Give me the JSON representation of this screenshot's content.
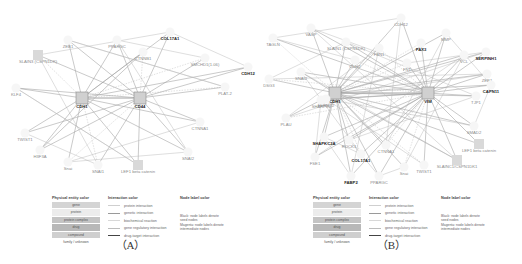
{
  "panels": [
    {
      "id": "A",
      "caption": "（A）",
      "nodes": [
        {
          "label": "SLAIN3 (CSPN1DK)",
          "x": 38,
          "y": 55,
          "dark": false,
          "shape": "square"
        },
        {
          "label": "ZEB1",
          "x": 68,
          "y": 40,
          "dark": false,
          "shape": "circle"
        },
        {
          "label": "PPARGC",
          "x": 117,
          "y": 40,
          "dark": false,
          "shape": "circle"
        },
        {
          "label": "COL17A1",
          "x": 170,
          "y": 32,
          "dark": true,
          "shape": "circle"
        },
        {
          "label": "CTNNB1",
          "x": 143,
          "y": 52,
          "dark": false,
          "shape": "circle"
        },
        {
          "label": "SMCHD1(1.06)",
          "x": 205,
          "y": 58,
          "dark": false,
          "shape": "circle"
        },
        {
          "label": "CDH12",
          "x": 248,
          "y": 67,
          "dark": true,
          "shape": "circle"
        },
        {
          "label": "KLF4",
          "x": 16,
          "y": 88,
          "dark": false,
          "shape": "circle"
        },
        {
          "label": "CDH1",
          "x": 82,
          "y": 98,
          "dark": true,
          "shape": "hub"
        },
        {
          "label": "CD44",
          "x": 140,
          "y": 98,
          "dark": true,
          "shape": "hub"
        },
        {
          "label": "PLAT-2",
          "x": 225,
          "y": 87,
          "dark": false,
          "shape": "circle"
        },
        {
          "label": "CTNNA1",
          "x": 200,
          "y": 122,
          "dark": false,
          "shape": "circle"
        },
        {
          "label": "TWIST1",
          "x": 25,
          "y": 133,
          "dark": false,
          "shape": "circle"
        },
        {
          "label": "H3F3A",
          "x": 40,
          "y": 150,
          "dark": false,
          "shape": "circle"
        },
        {
          "label": "Snai",
          "x": 68,
          "y": 162,
          "dark": false,
          "shape": "circle"
        },
        {
          "label": "SNAI1",
          "x": 98,
          "y": 165,
          "dark": false,
          "shape": "circle"
        },
        {
          "label": "LEF1 beta catenin",
          "x": 138,
          "y": 165,
          "dark": false,
          "shape": "square"
        },
        {
          "label": "SNAI2",
          "x": 188,
          "y": 152,
          "dark": false,
          "shape": "circle"
        }
      ]
    },
    {
      "id": "B",
      "caption": "（B）",
      "nodes": [
        {
          "label": "TAGLN",
          "x": 12,
          "y": 38,
          "dark": false,
          "shape": "circle"
        },
        {
          "label": "VASP",
          "x": 50,
          "y": 28,
          "dark": false,
          "shape": "circle"
        },
        {
          "label": "SLAIN1 (CSPN1DK)",
          "x": 85,
          "y": 42,
          "dark": false,
          "shape": "circle"
        },
        {
          "label": "CDH12",
          "x": 140,
          "y": 18,
          "dark": false,
          "shape": "circle"
        },
        {
          "label": "FBN1",
          "x": 118,
          "y": 48,
          "dark": false,
          "shape": "circle"
        },
        {
          "label": "PAX3",
          "x": 160,
          "y": 43,
          "dark": true,
          "shape": "circle"
        },
        {
          "label": "MMP",
          "x": 185,
          "y": 33,
          "dark": false,
          "shape": "circle"
        },
        {
          "label": "SERPINH1",
          "x": 225,
          "y": 52,
          "dark": true,
          "shape": "circle"
        },
        {
          "label": "VCL",
          "x": 203,
          "y": 55,
          "dark": false,
          "shape": "circle"
        },
        {
          "label": "CDH2",
          "x": 94,
          "y": 60,
          "dark": false,
          "shape": "circle"
        },
        {
          "label": "FN1",
          "x": 146,
          "y": 63,
          "dark": false,
          "shape": "circle"
        },
        {
          "label": "ZEB1",
          "x": 226,
          "y": 74,
          "dark": false,
          "shape": "circle"
        },
        {
          "label": "CAPN11",
          "x": 230,
          "y": 85,
          "dark": true,
          "shape": "circle"
        },
        {
          "label": "SNAI2",
          "x": 40,
          "y": 72,
          "dark": false,
          "shape": "circle"
        },
        {
          "label": "DSG3",
          "x": 8,
          "y": 79,
          "dark": false,
          "shape": "circle"
        },
        {
          "label": "CDH1",
          "x": 74,
          "y": 93,
          "dark": true,
          "shape": "hub"
        },
        {
          "label": "VIM",
          "x": 167,
          "y": 93,
          "dark": true,
          "shape": "hub"
        },
        {
          "label": "TJP1",
          "x": 215,
          "y": 96,
          "dark": false,
          "shape": "circle"
        },
        {
          "label": "FERMT2",
          "x": 65,
          "y": 99,
          "dark": false,
          "shape": "circle"
        },
        {
          "label": "PLAU",
          "x": 25,
          "y": 118,
          "dark": false,
          "shape": "circle"
        },
        {
          "label": "SHARPIN",
          "x": 60,
          "y": 100,
          "dark": false,
          "shape": "circle"
        },
        {
          "label": "SMAD2",
          "x": 213,
          "y": 126,
          "dark": false,
          "shape": "circle"
        },
        {
          "label": "SHAPKC2A",
          "x": 63,
          "y": 137,
          "dark": true,
          "shape": "circle"
        },
        {
          "label": "ROCK1",
          "x": 88,
          "y": 140,
          "dark": false,
          "shape": "circle"
        },
        {
          "label": "CTNNA1",
          "x": 125,
          "y": 145,
          "dark": false,
          "shape": "circle"
        },
        {
          "label": "COL17A1",
          "x": 100,
          "y": 154,
          "dark": true,
          "shape": "circle"
        },
        {
          "label": "FSE1",
          "x": 54,
          "y": 157,
          "dark": false,
          "shape": "circle"
        },
        {
          "label": "LEF1 beta catenin",
          "x": 218,
          "y": 144,
          "dark": false,
          "shape": "square"
        },
        {
          "label": "SLAINC1/CSPN1DK1",
          "x": 196,
          "y": 160,
          "dark": false,
          "shape": "square"
        },
        {
          "label": "Snai",
          "x": 143,
          "y": 167,
          "dark": false,
          "shape": "circle"
        },
        {
          "label": "TWIST1",
          "x": 163,
          "y": 165,
          "dark": false,
          "shape": "circle"
        },
        {
          "label": "FABP2",
          "x": 90,
          "y": 176,
          "dark": true,
          "shape": "circle"
        },
        {
          "label": "PPARGC",
          "x": 118,
          "y": 176,
          "dark": false,
          "shape": "circle"
        }
      ]
    }
  ],
  "legend": {
    "physical_entity_title": "Physical entity color",
    "physical_entities": [
      {
        "label": "gene",
        "color": "#d4d4d4"
      },
      {
        "label": "protein",
        "color": "#ececec"
      },
      {
        "label": "protein complex",
        "color": "#c4c4c4"
      },
      {
        "label": "drug",
        "color": "#b8b8b8"
      },
      {
        "label": "compound",
        "color": "#cfcfcf"
      },
      {
        "label": "family / unknown",
        "color": "#ffffff"
      }
    ],
    "interaction_title": "Interaction color",
    "interactions": [
      {
        "label": "protein interaction",
        "color": "#cfcfcf",
        "style": "solid"
      },
      {
        "label": "genetic interaction",
        "color": "#9a9a9a",
        "style": "solid"
      },
      {
        "label": "biochemical reaction",
        "color": "#d8d8d8",
        "style": "solid"
      },
      {
        "label": "gene regulatory interaction",
        "color": "#bcbcbc",
        "style": "solid"
      },
      {
        "label": "drug-target interaction",
        "color": "#444444",
        "style": "solid"
      }
    ],
    "node_label_title": "Node label color",
    "node_label_notes": [
      "Black: node labels denote",
      "seed nodes",
      "Magenta: node labels denote",
      "intermediate nodes"
    ]
  }
}
